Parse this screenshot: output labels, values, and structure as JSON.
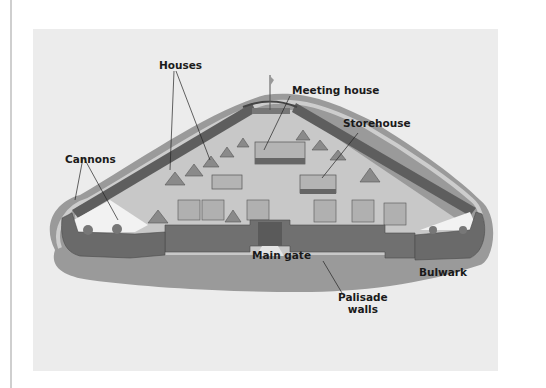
{
  "diagram": {
    "labels": {
      "houses": "Houses",
      "meeting_house": "Meeting house",
      "storehouse": "Storehouse",
      "cannons": "Cannons",
      "main_gate": "Main gate",
      "bulwark": "Bulwark",
      "palisade_line1": "Palisade",
      "palisade_line2": "walls"
    },
    "colors": {
      "background": "#ececec",
      "ground_shadow": "#9a9a9a",
      "courtyard": "#c8c8c8",
      "walls": "#6e6e6e",
      "roofs": "#a8a8a8",
      "text": "#1a1a1a"
    }
  }
}
